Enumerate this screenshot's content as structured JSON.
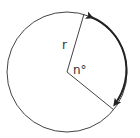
{
  "diagram": {
    "labels": {
      "radius": "r",
      "angle": "n°"
    },
    "colors": {
      "stroke": "#333333",
      "arc": "#222222",
      "background": "#ffffff"
    }
  }
}
